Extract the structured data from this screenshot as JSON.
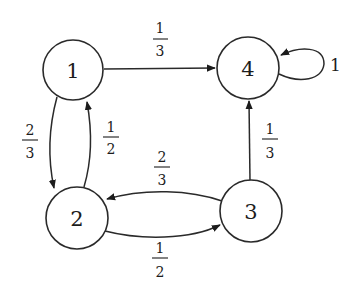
{
  "diagram": {
    "type": "markov-chain-state-diagram",
    "nodes": [
      {
        "id": "1",
        "label": "1"
      },
      {
        "id": "2",
        "label": "2"
      },
      {
        "id": "3",
        "label": "3"
      },
      {
        "id": "4",
        "label": "4"
      }
    ],
    "edges": [
      {
        "from": "1",
        "to": "4",
        "num": "1",
        "den": "3"
      },
      {
        "from": "1",
        "to": "2",
        "num": "2",
        "den": "3"
      },
      {
        "from": "2",
        "to": "1",
        "num": "1",
        "den": "2"
      },
      {
        "from": "3",
        "to": "2",
        "num": "2",
        "den": "3"
      },
      {
        "from": "2",
        "to": "3",
        "num": "1",
        "den": "2"
      },
      {
        "from": "3",
        "to": "4",
        "num": "1",
        "den": "3"
      },
      {
        "from": "4",
        "to": "4",
        "label": "1"
      }
    ]
  }
}
